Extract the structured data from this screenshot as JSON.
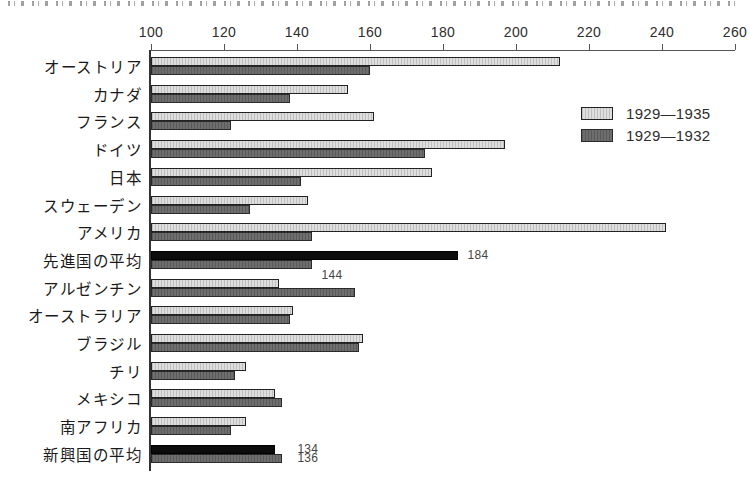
{
  "chart_data": {
    "type": "bar",
    "orientation": "horizontal-grouped",
    "title": "",
    "x_axis": {
      "position": "top",
      "min": 100,
      "max": 260,
      "tick_step": 20,
      "ticks": [
        100,
        120,
        140,
        160,
        180,
        200,
        220,
        240,
        260
      ]
    },
    "legend": {
      "position": "upper-right",
      "items": [
        {
          "label": "1929—1935",
          "swatch": "light"
        },
        {
          "label": "1929—1932",
          "swatch": "dark"
        }
      ]
    },
    "colors": {
      "light_series": "#dedede",
      "dark_series": "#6e6e6e",
      "emphasis_bar": "#0c0c0c",
      "bar_border": "#222222",
      "axis": "#555555"
    },
    "series_order": [
      "1929—1935",
      "1929—1932"
    ],
    "rows": [
      {
        "label": "オーストリア",
        "v": [
          212,
          160
        ]
      },
      {
        "label": "カナダ",
        "v": [
          154,
          138
        ]
      },
      {
        "label": "フランス",
        "v": [
          161,
          122
        ]
      },
      {
        "label": "ドイツ",
        "v": [
          197,
          175
        ]
      },
      {
        "label": "日本",
        "v": [
          177,
          141
        ]
      },
      {
        "label": "スウェーデン",
        "v": [
          143,
          127
        ]
      },
      {
        "label": "アメリカ",
        "v": [
          241,
          144
        ]
      },
      {
        "label": "先進国の平均",
        "v": [
          184,
          144
        ],
        "emphasis": true,
        "value_labels": [
          {
            "series_index": 0,
            "text": "184",
            "placement": "right"
          },
          {
            "series_index": 1,
            "text": "144",
            "placement": "below"
          }
        ]
      },
      {
        "label": "アルゼンチン",
        "v": [
          135,
          156
        ]
      },
      {
        "label": "オーストラリア",
        "v": [
          139,
          138
        ]
      },
      {
        "label": "ブラジル",
        "v": [
          158,
          157
        ]
      },
      {
        "label": "チリ",
        "v": [
          126,
          123
        ]
      },
      {
        "label": "メキシコ",
        "v": [
          134,
          136
        ]
      },
      {
        "label": "南アフリカ",
        "v": [
          126,
          122
        ]
      },
      {
        "label": "新興国の平均",
        "v": [
          134,
          136
        ],
        "emphasis": true,
        "value_labels": [
          {
            "series_index": 0,
            "text": "134",
            "placement": "right"
          },
          {
            "series_index": 1,
            "text": "136",
            "placement": "right"
          }
        ]
      }
    ]
  }
}
